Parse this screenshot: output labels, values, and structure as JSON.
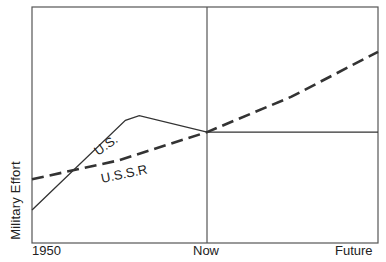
{
  "chart_data": {
    "type": "line",
    "title": "",
    "xlabel": "",
    "ylabel": "Military Effort",
    "x_tick_labels": [
      "1950",
      "Now",
      "Future"
    ],
    "x_range": [
      0,
      1
    ],
    "x_tick_positions": [
      0,
      0.506,
      1
    ],
    "y_range": [
      0,
      100
    ],
    "grid": false,
    "legend": "inline labels",
    "series": [
      {
        "name": "U.S.",
        "style": "solid",
        "points": [
          [
            0.0,
            14
          ],
          [
            0.27,
            52
          ],
          [
            0.31,
            54
          ],
          [
            0.506,
            47
          ],
          [
            1.0,
            47
          ]
        ]
      },
      {
        "name": "U.S.S.R",
        "style": "dashed",
        "points": [
          [
            0.0,
            27
          ],
          [
            0.25,
            35
          ],
          [
            0.506,
            47
          ],
          [
            0.75,
            62
          ],
          [
            1.0,
            81
          ]
        ]
      }
    ],
    "annotations": [
      {
        "text": "U.S.",
        "near_series": "U.S."
      },
      {
        "text": "U.S.S.R",
        "near_series": "U.S.S.R"
      }
    ]
  },
  "labels": {
    "ylabel": "Military Effort",
    "tick_1950": "1950",
    "tick_now": "Now",
    "tick_future": "Future",
    "series_us": "U.S.",
    "series_ussr": "U.S.S.R"
  }
}
